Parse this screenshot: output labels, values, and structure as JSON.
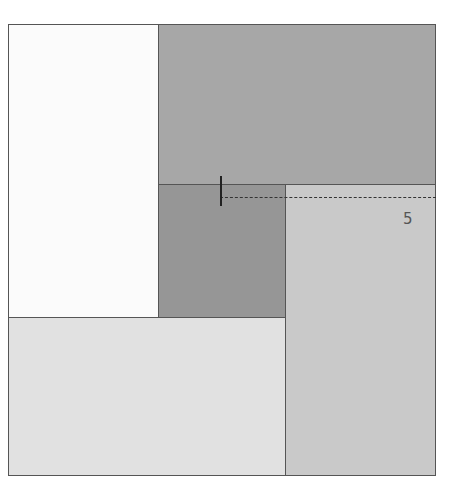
{
  "diagram": {
    "title": "",
    "regions": [
      {
        "id": "top-left",
        "x": 8,
        "y": 24,
        "w": 151,
        "h": 294,
        "color": "#fbfbfb"
      },
      {
        "id": "top-right",
        "x": 158,
        "y": 24,
        "w": 278,
        "h": 161,
        "color": "#a7a7a7"
      },
      {
        "id": "center",
        "x": 158,
        "y": 184,
        "w": 128,
        "h": 134,
        "color": "#969696"
      },
      {
        "id": "right-column",
        "x": 285,
        "y": 184,
        "w": 151,
        "h": 292,
        "color": "#c9c9c9"
      },
      {
        "id": "bottom-left",
        "x": 8,
        "y": 317,
        "w": 278,
        "h": 159,
        "color": "#e1e1e1"
      }
    ],
    "marker": {
      "x": 220,
      "y": 176,
      "h": 30
    },
    "dashed_line": {
      "x1": 220,
      "x2": 436,
      "y": 197
    },
    "label": {
      "text": "5",
      "x": 403,
      "y": 212
    }
  }
}
